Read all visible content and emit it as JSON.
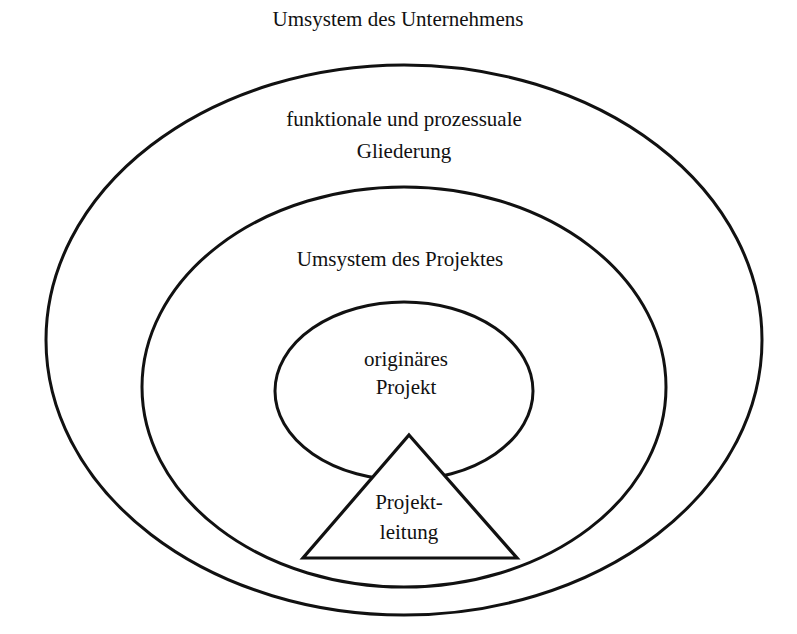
{
  "diagram": {
    "type": "nested-systems",
    "labels": {
      "outer_title": "Umsystem des Unternehmens",
      "outer_inner_line1": "funktionale und prozessuale",
      "outer_inner_line2": "Gliederung",
      "middle": "Umsystem des Projektes",
      "core_line1": "originäres",
      "core_line2": "Projekt",
      "lead_line1": "Projekt-",
      "lead_line2": "leitung"
    },
    "shapes": [
      {
        "id": "outer-ellipse",
        "shape": "ellipse",
        "label_ref": "outer_inner"
      },
      {
        "id": "middle-ellipse",
        "shape": "ellipse",
        "label_ref": "middle"
      },
      {
        "id": "core-ellipse",
        "shape": "ellipse",
        "label_ref": "core"
      },
      {
        "id": "lead-triangle",
        "shape": "triangle",
        "label_ref": "lead"
      }
    ],
    "colors": {
      "stroke": "#111111",
      "fill": "#ffffff",
      "text": "#111111"
    }
  }
}
